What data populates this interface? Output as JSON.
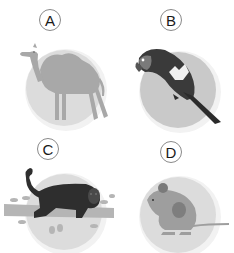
{
  "options": [
    {
      "letter": "A",
      "animal": "camel",
      "icon": "camel-icon"
    },
    {
      "letter": "B",
      "animal": "parrot",
      "icon": "parrot-icon"
    },
    {
      "letter": "C",
      "animal": "monkey",
      "icon": "monkey-icon"
    },
    {
      "letter": "D",
      "animal": "mouse",
      "icon": "mouse-icon"
    }
  ],
  "colors": {
    "disc": "#dcdcdc",
    "disc_dark": "#c9c9c9",
    "camel": "#a8a8a8",
    "parrot": "#3a3a3a",
    "monkey": "#2e2e2e",
    "mouse": "#9e9e9e",
    "branch": "#b5b5b5"
  }
}
